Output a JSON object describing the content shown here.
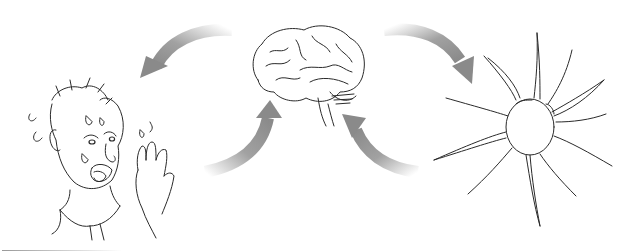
{
  "figure": {
    "elements": [
      {
        "id": "person",
        "label": "person-tasting-sour"
      },
      {
        "id": "brain",
        "label": "brain"
      },
      {
        "id": "neuron",
        "label": "neuron"
      }
    ],
    "arrows": [
      {
        "from": "brain",
        "to": "person"
      },
      {
        "from": "person",
        "to": "brain"
      },
      {
        "from": "brain",
        "to": "neuron"
      },
      {
        "from": "neuron",
        "to": "brain"
      }
    ],
    "colors": {
      "arrow": "#8a8a8a",
      "ink": "#2a2a2a",
      "background": "#ffffff"
    }
  }
}
